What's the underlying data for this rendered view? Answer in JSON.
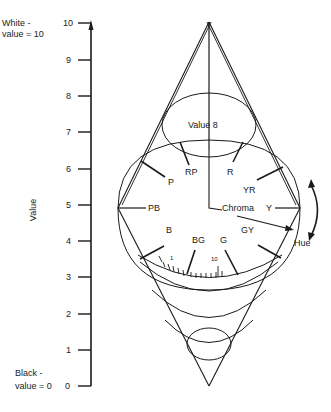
{
  "left_labels": {
    "white_line1": "White  -",
    "white_line2": "value = 10",
    "black_line1": "Black  -",
    "black_line2": "value = 0",
    "axis_title": "Value"
  },
  "value_axis": {
    "ticks": [
      "10",
      "9",
      "8",
      "7",
      "6",
      "5",
      "4",
      "3",
      "2",
      "1",
      "0"
    ]
  },
  "solid": {
    "value_plane_label": "Value 8",
    "chroma_label": "Chroma",
    "hue_label": "Hue",
    "chroma_scale": {
      "start": "1",
      "end": "10"
    },
    "hues": {
      "RP": "RP",
      "R": "R",
      "P": "P",
      "YR": "YR",
      "PB": "PB",
      "Y": "Y",
      "B": "B",
      "BG": "BG",
      "G": "G",
      "GY": "GY"
    }
  },
  "colors": {
    "ink": "#1a1a1a",
    "background": "#ffffff"
  }
}
